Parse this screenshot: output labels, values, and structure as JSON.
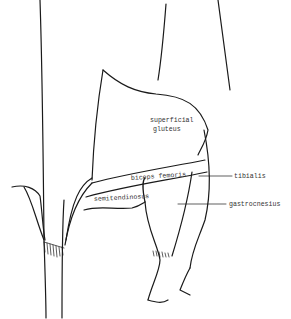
{
  "diagram": {
    "type": "anatomical-line-drawing",
    "colors": {
      "background": "#ffffff",
      "line": "#1a1a1a",
      "label": "#333333"
    },
    "labels": [
      {
        "id": "superficial-gluteus",
        "line1": "superficial",
        "line2": "gluteus"
      },
      {
        "id": "biceps-femoris",
        "text": "biceps femoris"
      },
      {
        "id": "semitendinosus",
        "text": "semitendinosus"
      },
      {
        "id": "tibialis",
        "text": "tibialis"
      },
      {
        "id": "gastrocnemius",
        "text": "gastrocnesius"
      }
    ]
  }
}
